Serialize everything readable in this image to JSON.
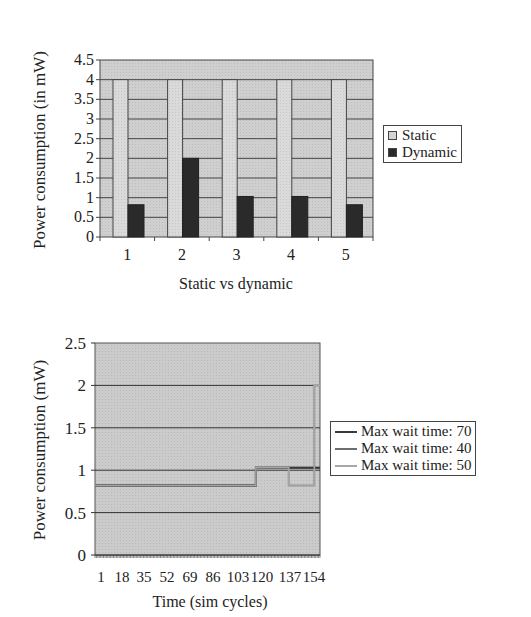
{
  "chart_data": [
    {
      "type": "bar",
      "title": "",
      "xlabel": "Static vs dynamic",
      "ylabel": "Power consumption (in mW)",
      "categories": [
        "1",
        "2",
        "3",
        "4",
        "5"
      ],
      "series": [
        {
          "name": "Static",
          "values": [
            4,
            4,
            4,
            4,
            4
          ],
          "color": "#d4d4d4"
        },
        {
          "name": "Dynamic",
          "values": [
            0.82,
            2.0,
            1.03,
            1.03,
            0.82
          ],
          "color": "#2a2a2a"
        }
      ],
      "ylim": [
        0,
        4.5
      ],
      "yticks": [
        "0",
        "0.5",
        "1",
        "1.5",
        "2",
        "2.5",
        "3",
        "3.5",
        "4",
        "4.5"
      ],
      "grid": true,
      "legend_position": "right",
      "plot_background": "#cccccc"
    },
    {
      "type": "line",
      "title": "",
      "xlabel": "Time (sim cycles)",
      "ylabel": "Power consumption (mW)",
      "xticks": [
        "1",
        "18",
        "35",
        "52",
        "69",
        "86",
        "103",
        "120",
        "137",
        "154"
      ],
      "ylim": [
        0,
        2.5
      ],
      "yticks": [
        "0",
        "0.5",
        "1",
        "1.5",
        "2",
        "2.5"
      ],
      "grid": true,
      "legend_position": "right",
      "plot_background": "#c8c8c8",
      "series": [
        {
          "name": "Max wait time: 70",
          "color": "#3a3a3a",
          "points": [
            [
              1,
              0.82
            ],
            [
              114,
              0.82
            ],
            [
              114,
              1.03
            ],
            [
              159,
              1.03
            ]
          ]
        },
        {
          "name": "Max wait time: 40",
          "color": "#6e6e6e",
          "points": [
            [
              1,
              0.82
            ],
            [
              114,
              0.82
            ],
            [
              114,
              1.03
            ],
            [
              159,
              1.03
            ]
          ]
        },
        {
          "name": "Max wait time: 50",
          "color": "#9a9a9a",
          "points": [
            [
              1,
              0.82
            ],
            [
              114,
              0.82
            ],
            [
              114,
              1.03
            ],
            [
              137,
              1.03
            ],
            [
              137,
              0.82
            ],
            [
              155,
              0.82
            ],
            [
              155,
              2.0
            ],
            [
              159,
              2.0
            ]
          ]
        }
      ]
    }
  ],
  "top_chart": {
    "ylabel": "Power consumption (in mW)",
    "xlabel": "Static vs dynamic",
    "legend": [
      "Static",
      "Dynamic"
    ]
  },
  "bottom_chart": {
    "ylabel": "Power consumption (mW)",
    "xlabel": "Time (sim cycles)",
    "legend": [
      "Max wait time: 70",
      "Max wait time: 40",
      "Max wait time: 50"
    ]
  }
}
